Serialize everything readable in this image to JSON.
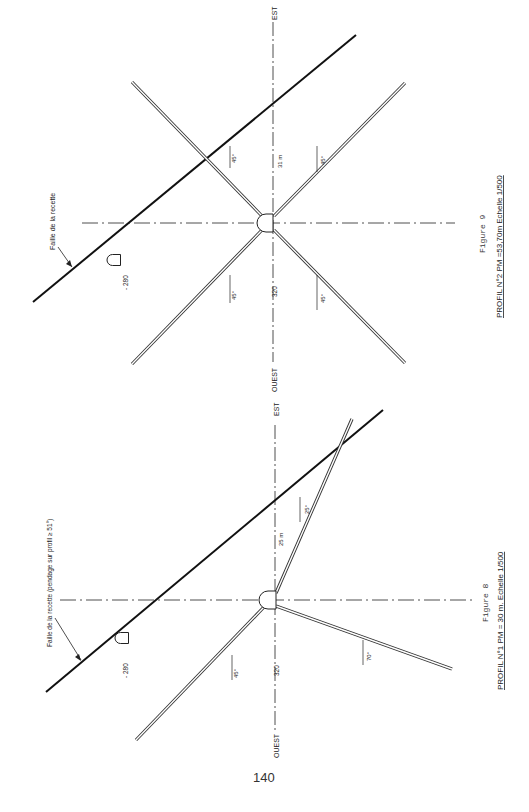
{
  "page": {
    "number": "140"
  },
  "figures": [
    {
      "id": "figure-9",
      "caption_title": "Figure 9",
      "caption": "PROFIL  N°2  PM =53,70m  Echelle 1/500",
      "axis_left": "OUEST",
      "axis_right": "EST",
      "level_label": "320",
      "distance_label": "31 m",
      "old_gallery_level": "- 280",
      "fault_label": "Faille de la recette",
      "angles": [
        "45°",
        "45°",
        "45°",
        "45°"
      ]
    },
    {
      "id": "figure-8",
      "caption_title": "Figure 8",
      "caption": "PROFIL  N°1  PM = 30 m.  Echelle 1/500",
      "axis_left": "OUEST",
      "axis_right": "EST",
      "level_label": "320",
      "distance_label": "25 m",
      "old_gallery_level": "- 280",
      "fault_label": "Faille de la recette (pendage sur profil ≥ 51°)",
      "angles": [
        "45°",
        "25°",
        "70°"
      ]
    }
  ]
}
